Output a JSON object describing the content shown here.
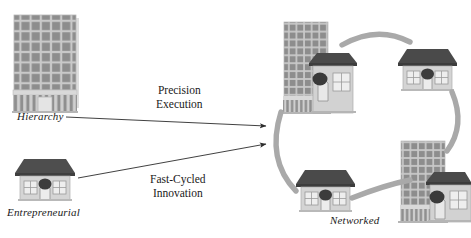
{
  "diagram": {
    "title_labels": {
      "hierarchy": "Hierarchy",
      "entrepreneurial": "Entrepreneurial",
      "networked": "Networked"
    },
    "arrows": [
      {
        "id": "precision-execution",
        "line1": "Precision",
        "line2": "Execution"
      },
      {
        "id": "fast-cycled-innovation",
        "line1": "Fast-Cycled",
        "line2": "Innovation"
      }
    ],
    "colors": {
      "tower_body": "#909090",
      "tower_mullion": "#c4c4c4",
      "tower_base": "#d8d8d8",
      "house_roof": "#4a4a4a",
      "house_body": "#d5d5d5",
      "house_window": "#e8e8e8",
      "bush": "#3c3c3c",
      "arc": "#a9a9a9",
      "arrow": "#2b2b2b",
      "text": "#1a1a1a",
      "background": "#ffffff"
    },
    "nodes": [
      {
        "id": "hierarchy-tower",
        "type": "tower",
        "x": 14,
        "y": 14
      },
      {
        "id": "entrepreneurial-house",
        "type": "house",
        "x": 14,
        "y": 155
      },
      {
        "id": "networked-top-left",
        "type": "tower-house",
        "x": 281,
        "y": 18
      },
      {
        "id": "networked-top-right",
        "type": "house",
        "x": 396,
        "y": 47
      },
      {
        "id": "networked-bottom-left",
        "type": "house",
        "x": 294,
        "y": 168
      },
      {
        "id": "networked-bottom-right",
        "type": "tower-house",
        "x": 398,
        "y": 137
      }
    ],
    "connectors": [
      {
        "id": "arc-top",
        "from": "networked-top-left",
        "to": "networked-top-right"
      },
      {
        "id": "arc-right",
        "from": "networked-top-right",
        "to": "networked-bottom-right"
      },
      {
        "id": "arc-bottom",
        "from": "networked-bottom-right",
        "to": "networked-bottom-left"
      },
      {
        "id": "arc-left",
        "from": "networked-bottom-left",
        "to": "networked-top-left"
      }
    ]
  }
}
